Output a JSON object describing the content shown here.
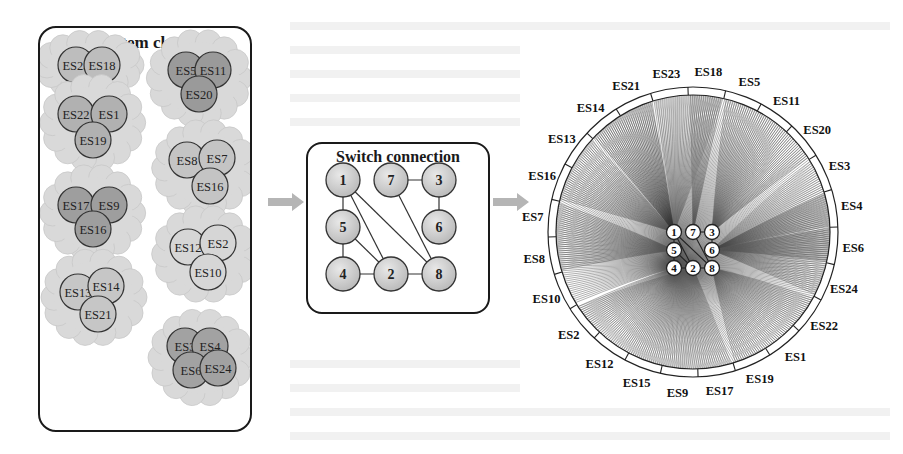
{
  "cluster_panel": {
    "title": "End system clustering",
    "clusters": [
      {
        "members": [
          "ES23",
          "ES18"
        ],
        "fill": "#bdbdbd"
      },
      {
        "members": [
          "ES5",
          "ES11",
          "ES20"
        ],
        "fill": "#9a9a9a"
      },
      {
        "members": [
          "ES22",
          "ES1",
          "ES19"
        ],
        "fill": "#b1b1b1"
      },
      {
        "members": [
          "ES8",
          "ES7",
          "ES16"
        ],
        "fill": "#c4c4c4"
      },
      {
        "members": [
          "ES17",
          "ES9",
          "ES16"
        ],
        "fill": "#9e9e9e"
      },
      {
        "members": [
          "ES12",
          "ES2",
          "ES10"
        ],
        "fill": "#d6d6d6"
      },
      {
        "members": [
          "ES13",
          "ES14",
          "ES21"
        ],
        "fill": "#c6c6c6"
      },
      {
        "members": [
          "ES3",
          "ES4",
          "ES6",
          "ES24"
        ],
        "fill": "#a2a2a2"
      }
    ]
  },
  "switch_panel": {
    "title": "Switch connection",
    "switches": [
      "1",
      "7",
      "3",
      "5",
      "6",
      "4",
      "2",
      "8"
    ],
    "links": [
      [
        "1",
        "5"
      ],
      [
        "5",
        "4"
      ],
      [
        "4",
        "2"
      ],
      [
        "2",
        "8"
      ],
      [
        "7",
        "3"
      ],
      [
        "3",
        "6"
      ],
      [
        "1",
        "2"
      ],
      [
        "1",
        "8"
      ],
      [
        "7",
        "8"
      ],
      [
        "5",
        "2"
      ]
    ]
  },
  "circular_panel": {
    "end_systems": [
      "ES18",
      "ES5",
      "ES11",
      "ES20",
      "ES3",
      "ES4",
      "ES6",
      "ES24",
      "ES22",
      "ES1",
      "ES19",
      "ES17",
      "ES9",
      "ES15",
      "ES12",
      "ES2",
      "ES10",
      "ES8",
      "ES7",
      "ES16",
      "ES13",
      "ES14",
      "ES21",
      "ES23"
    ],
    "switches": [
      "1",
      "7",
      "3",
      "5",
      "6",
      "4",
      "2",
      "8"
    ],
    "switch_links": [
      [
        "1",
        "5"
      ],
      [
        "5",
        "4"
      ],
      [
        "4",
        "2"
      ],
      [
        "2",
        "8"
      ],
      [
        "7",
        "3"
      ],
      [
        "3",
        "6"
      ],
      [
        "1",
        "2"
      ],
      [
        "1",
        "8"
      ],
      [
        "7",
        "8"
      ],
      [
        "5",
        "2"
      ]
    ],
    "fans": [
      {
        "switch": "7",
        "from": "ES18",
        "to": "ES18",
        "shade": "#555555"
      },
      {
        "switch": "1",
        "from": "ES23",
        "to": "ES18",
        "shade": "#888888"
      },
      {
        "switch": "3",
        "from": "ES5",
        "to": "ES20",
        "shade": "#5a5a5a"
      },
      {
        "switch": "6",
        "from": "ES3",
        "to": "ES4",
        "shade": "#999999"
      },
      {
        "switch": "6",
        "from": "ES4",
        "to": "ES6",
        "shade": "#333333"
      },
      {
        "switch": "6",
        "from": "ES6",
        "to": "ES24",
        "shade": "#555555"
      },
      {
        "switch": "8",
        "from": "ES22",
        "to": "ES19",
        "shade": "#666666"
      },
      {
        "switch": "2",
        "from": "ES17",
        "to": "ES2",
        "shade": "#777777"
      },
      {
        "switch": "4",
        "from": "ES10",
        "to": "ES2",
        "shade": "#555555"
      },
      {
        "switch": "5",
        "from": "ES8",
        "to": "ES7",
        "shade": "#555555"
      },
      {
        "switch": "1",
        "from": "ES16",
        "to": "ES13",
        "shade": "#555555"
      },
      {
        "switch": "1",
        "from": "ES14",
        "to": "ES21",
        "shade": "#333333"
      }
    ]
  },
  "arrows": [
    {
      "from": "cluster_panel",
      "to": "switch_panel",
      "color": "#b5b5b5"
    },
    {
      "from": "switch_panel",
      "to": "circular_panel",
      "color": "#b5b5b5"
    }
  ]
}
